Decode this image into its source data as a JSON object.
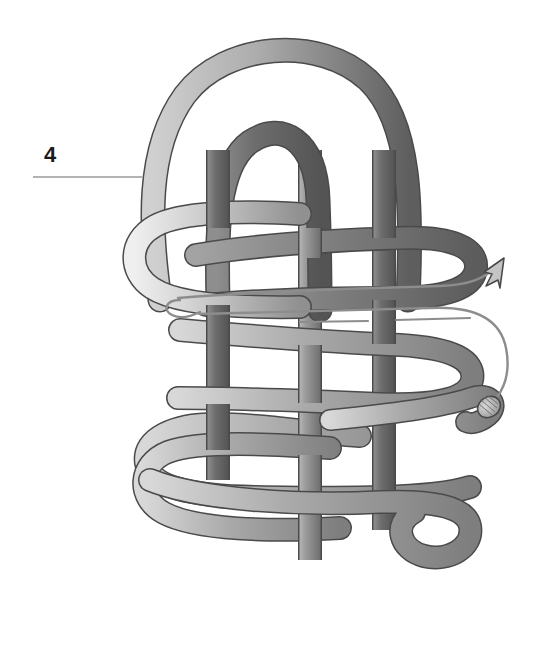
{
  "figure": {
    "background_color": "#ffffff",
    "canvas": {
      "width": 546,
      "height": 663
    }
  },
  "callout": {
    "number": "4",
    "number_x": 44,
    "number_y": 146,
    "leader_line": {
      "x1": 33,
      "y1": 177,
      "x2": 142,
      "y2": 177
    },
    "leader_color": "#9a9a9a"
  },
  "rope": {
    "outline_color": "#4a4a4a",
    "light_fill_start": "#e8e8e8",
    "light_fill_end": "#9c9c9c",
    "mid_fill_start": "#c9c9c9",
    "mid_fill_end": "#8a8a8a",
    "dark_fill_start": "#8d8d8d",
    "dark_fill_end": "#5f5f5f",
    "width": 22,
    "outline_width": 1.6
  },
  "working_end": {
    "line_color": "#8d8d8d",
    "line_width": 2.2,
    "arrow_label": "direction-arrow",
    "arrow_fill": "#c4c4c4",
    "tip_label": "whipped rope end",
    "tip_fill": "#bdbdbd"
  },
  "structure": {
    "vertical_standing_parts": 4,
    "horizontal_bights": 4,
    "left_bights": 4,
    "right_bights": 3,
    "bottom_loops": 2,
    "top_arches": 2
  },
  "legend": {
    "note": ""
  }
}
